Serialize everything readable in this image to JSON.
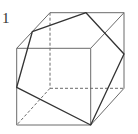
{
  "figure": {
    "label": "1",
    "colors": {
      "edge": "#6a6a6a",
      "section": "#333333",
      "background": "#ffffff"
    },
    "cube": {
      "front_face": [
        [
          16.7,
          48.3
        ],
        [
          90.7,
          48.3
        ],
        [
          90.7,
          125
        ],
        [
          16.7,
          125
        ]
      ],
      "back_face": [
        [
          50,
          12.7
        ],
        [
          124,
          12.7
        ],
        [
          124,
          88.3
        ],
        [
          50,
          88.3
        ]
      ],
      "hidden_edges": [
        [
          [
            50,
            12.7
          ],
          [
            50,
            88.3
          ]
        ],
        [
          [
            50,
            88.3
          ],
          [
            124,
            88.3
          ]
        ],
        [
          [
            50,
            88.3
          ],
          [
            16.7,
            125
          ]
        ]
      ]
    },
    "section_polygon": [
      [
        32.3,
        31.7
      ],
      [
        86,
        12.7
      ],
      [
        124,
        54
      ],
      [
        90.7,
        125
      ],
      [
        16.7,
        87.3
      ]
    ]
  }
}
